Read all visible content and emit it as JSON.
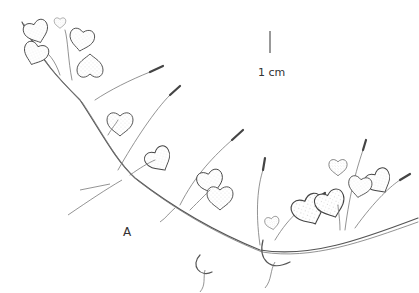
{
  "figure": {
    "panel_label": "A",
    "scale_bar": {
      "label": "1 cm"
    },
    "colors": {
      "background": "#ffffff",
      "ink": "#444444"
    }
  }
}
